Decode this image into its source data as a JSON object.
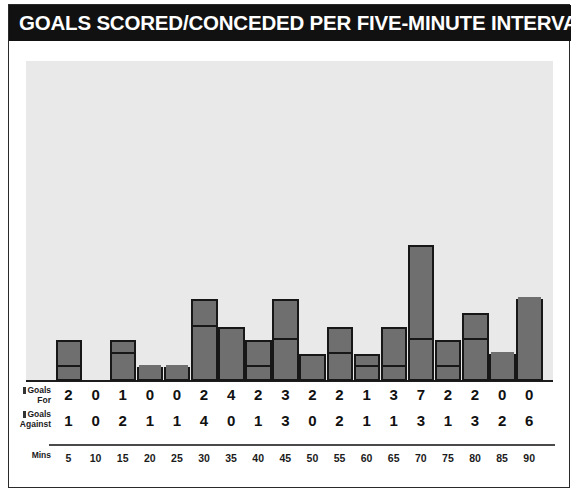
{
  "header": {
    "title": "GOALS SCORED/CONCEDED PER FIVE-MINUTE INTERVALS"
  },
  "legend": {
    "goals_for_label_line1": "Goals",
    "goals_for_label_line2": "For",
    "goals_against_label_line1": "Goals",
    "goals_against_label_line2": "Against",
    "mins_label": "Mins"
  },
  "colors": {
    "title_bg": "#111111",
    "title_fg": "#ffffff",
    "plot_bg": "#e9e9e9",
    "bar_fill": "#6f6f6f",
    "bar_stroke": "#171717",
    "panel_border": "#2a2a2a"
  },
  "chart_data": {
    "type": "bar",
    "title": "GOALS SCORED/CONCEDED PER FIVE-MINUTE INTERVALS",
    "xlabel": "Mins",
    "ylabel": "",
    "stacked": true,
    "grid": false,
    "legend_position": "left",
    "ylim": [
      0,
      10
    ],
    "categories": [
      "5",
      "10",
      "15",
      "20",
      "25",
      "30",
      "35",
      "40",
      "45",
      "50",
      "55",
      "60",
      "65",
      "70",
      "75",
      "80",
      "85",
      "90"
    ],
    "series": [
      {
        "name": "Goals For",
        "values": [
          2,
          0,
          1,
          0,
          0,
          2,
          4,
          2,
          3,
          2,
          2,
          1,
          3,
          7,
          2,
          2,
          0,
          0
        ]
      },
      {
        "name": "Goals Against",
        "values": [
          1,
          0,
          2,
          1,
          1,
          4,
          0,
          1,
          3,
          0,
          2,
          1,
          1,
          3,
          1,
          3,
          2,
          6
        ]
      }
    ],
    "totals": [
      3,
      0,
      3,
      1,
      1,
      6,
      4,
      3,
      6,
      2,
      4,
      2,
      4,
      10,
      3,
      5,
      2,
      6
    ]
  }
}
